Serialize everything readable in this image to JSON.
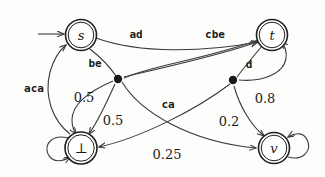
{
  "figure": {
    "kind": "directed-graph"
  },
  "nodes": [
    {
      "id": "s",
      "label": "s",
      "x": 81,
      "y": 35,
      "accepting": true,
      "initial": true
    },
    {
      "id": "t",
      "label": "t",
      "x": 272,
      "y": 35,
      "accepting": true,
      "initial": false
    },
    {
      "id": "bottom",
      "label": "⊥",
      "x": 81,
      "y": 148,
      "accepting": true,
      "initial": false
    },
    {
      "id": "v",
      "label": "v",
      "x": 274,
      "y": 148,
      "accepting": true,
      "initial": false
    }
  ],
  "junctions": [
    {
      "id": "left-junction",
      "x": 118,
      "y": 79
    },
    {
      "id": "right-junction",
      "x": 233,
      "y": 80
    }
  ],
  "edge_labels": {
    "ad": "ad",
    "cbe": "cbe",
    "be": "be",
    "d": "d",
    "aca": "aca",
    "ca": "ca"
  },
  "probability_labels": {
    "p_be_bottom": "0.5",
    "p_be_s": "0.5",
    "p_d_t": "0.8",
    "p_d_v": "0.2",
    "p_ca_v": "0.25"
  },
  "colors": {
    "stroke": "#3a3a3a",
    "node_stroke": "#1f1f1f",
    "text": "#1a1a1a",
    "background": "#fdfdfc"
  }
}
